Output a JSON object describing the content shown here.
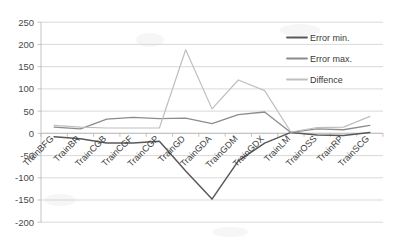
{
  "chart_data": {
    "type": "line",
    "title": "",
    "xlabel": "",
    "ylabel": "",
    "ylim": [
      -200,
      250
    ],
    "yticks": [
      250,
      200,
      150,
      100,
      50,
      0,
      -50,
      -100,
      -150,
      -200
    ],
    "grid": true,
    "legend_position": "right",
    "categories": [
      "TrainBFG",
      "TrainBR",
      "TrainCGB",
      "TrainCGF",
      "TrainCGP",
      "TrainGD",
      "TrainGDA",
      "TrainGDM",
      "TrainGDX",
      "TrainLM",
      "TrainOSS",
      "TrainRP",
      "TrainSCG"
    ],
    "series": [
      {
        "name": "Error min.",
        "color": "#595959",
        "values": [
          -8,
          -12,
          -22,
          -22,
          -18,
          -85,
          -148,
          -62,
          -22,
          2,
          -4,
          -5,
          2
        ]
      },
      {
        "name": "Error max.",
        "color": "#8c8c8c",
        "values": [
          14,
          10,
          32,
          36,
          33,
          34,
          22,
          42,
          48,
          2,
          10,
          8,
          18
        ]
      },
      {
        "name": "Diffence",
        "color": "#bfbfbf",
        "values": [
          18,
          14,
          12,
          12,
          12,
          188,
          55,
          120,
          96,
          3,
          13,
          14,
          38
        ]
      }
    ]
  },
  "legend": {
    "items": [
      {
        "label": "Error min.",
        "color": "#595959"
      },
      {
        "label": "Error max.",
        "color": "#8c8c8c"
      },
      {
        "label": "Diffence",
        "color": "#bfbfbf"
      }
    ]
  },
  "axis": {
    "y_tick_labels": [
      "250",
      "200",
      "150",
      "100",
      "50",
      "0",
      "-50",
      "-100",
      "-150",
      "-200"
    ]
  }
}
